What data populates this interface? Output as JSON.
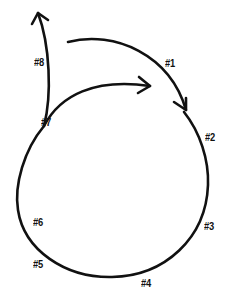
{
  "diagram": {
    "type": "cycle",
    "stroke_color": "#111111",
    "background": "#ffffff",
    "labels": [
      {
        "id": "1",
        "text": "#1",
        "x": 165,
        "y": 58
      },
      {
        "id": "2",
        "text": "#2",
        "x": 206,
        "y": 133
      },
      {
        "id": "3",
        "text": "#3",
        "x": 204,
        "y": 222
      },
      {
        "id": "4",
        "text": "#4",
        "x": 141,
        "y": 279
      },
      {
        "id": "5",
        "text": "#5",
        "x": 33,
        "y": 260
      },
      {
        "id": "6",
        "text": "#6",
        "x": 33,
        "y": 218
      },
      {
        "id": "7",
        "text": "#7",
        "x": 41,
        "y": 118
      },
      {
        "id": "8",
        "text": "#8",
        "x": 34,
        "y": 57
      }
    ],
    "arrows": [
      {
        "name": "branch-up-arrow",
        "from": "#7",
        "to": "up",
        "description": "arrow from #7 branching upward past #8"
      },
      {
        "name": "inner-arrow",
        "from": "#7",
        "to": "right",
        "description": "inner arc from #7 curving right"
      },
      {
        "name": "outer-arrow",
        "from": "top-left",
        "to": "#2",
        "description": "outer arc over #1 pointing down toward #2"
      }
    ]
  }
}
